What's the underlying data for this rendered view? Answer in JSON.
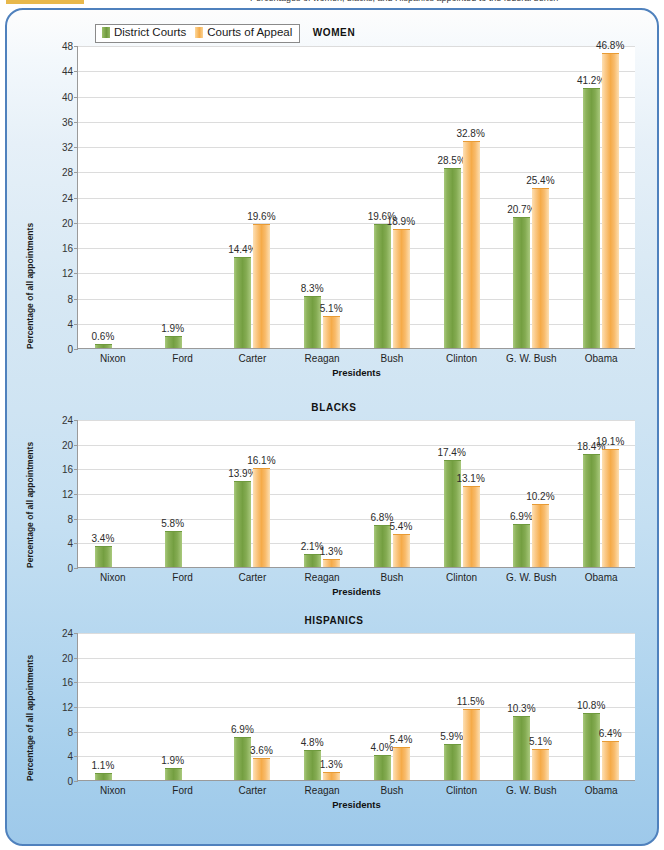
{
  "caption": {
    "highlight": "",
    "text": "Percentages of women, blacks, and Hispanics appointed to the federal bench"
  },
  "legend": {
    "series": [
      {
        "label": "District Courts",
        "color": "#7aa344",
        "key": "district"
      },
      {
        "label": "Courts of Appeal",
        "color": "#f5ab49",
        "key": "appeal"
      }
    ]
  },
  "axis": {
    "ylabel": "Percentage of all appointments",
    "xlabel": "Presidents"
  },
  "chart_data": [
    {
      "type": "bar",
      "title": "WOMEN",
      "xlabel": "Presidents",
      "ylabel": "Percentage of all appointments",
      "ylim": [
        0,
        48
      ],
      "ytick_step": 4,
      "yticks": [
        0,
        4,
        8,
        12,
        16,
        20,
        24,
        28,
        32,
        36,
        40,
        44,
        48
      ],
      "grid": true,
      "legend_position": "top-left",
      "categories": [
        "Nixon",
        "Ford",
        "Carter",
        "Reagan",
        "Bush",
        "Clinton",
        "G. W. Bush",
        "Obama"
      ],
      "series": [
        {
          "name": "District Courts",
          "values": [
            0.6,
            1.9,
            14.4,
            8.3,
            19.6,
            28.5,
            20.7,
            41.2
          ],
          "labels": [
            "0.6%",
            "1.9%",
            "14.4%",
            "8.3%",
            "19.6%",
            "28.5%",
            "20.7%",
            "41.2%"
          ]
        },
        {
          "name": "Courts of Appeal",
          "values": [
            0.0,
            0.0,
            19.6,
            5.1,
            18.9,
            32.8,
            25.4,
            46.8
          ],
          "labels": [
            "",
            "",
            "19.6%",
            "5.1%",
            "18.9%",
            "32.8%",
            "25.4%",
            "46.8%"
          ]
        }
      ]
    },
    {
      "type": "bar",
      "title": "BLACKS",
      "xlabel": "Presidents",
      "ylabel": "Percentage of all appointments",
      "ylim": [
        0,
        24
      ],
      "ytick_step": 4,
      "yticks": [
        0,
        4,
        8,
        12,
        16,
        20,
        24
      ],
      "grid": true,
      "categories": [
        "Nixon",
        "Ford",
        "Carter",
        "Reagan",
        "Bush",
        "Clinton",
        "G. W. Bush",
        "Obama"
      ],
      "series": [
        {
          "name": "District Courts",
          "values": [
            3.4,
            5.8,
            13.9,
            2.1,
            6.8,
            17.4,
            6.9,
            18.4
          ],
          "labels": [
            "3.4%",
            "5.8%",
            "13.9%",
            "2.1%",
            "6.8%",
            "17.4%",
            "6.9%",
            "18.4%"
          ]
        },
        {
          "name": "Courts of Appeal",
          "values": [
            0.0,
            0.0,
            16.1,
            1.3,
            5.4,
            13.1,
            10.2,
            19.1
          ],
          "labels": [
            "",
            "",
            "16.1%",
            "1.3%",
            "5.4%",
            "13.1%",
            "10.2%",
            "19.1%"
          ]
        }
      ]
    },
    {
      "type": "bar",
      "title": "HISPANICS",
      "xlabel": "Presidents",
      "ylabel": "Percentage of all appointments",
      "ylim": [
        0,
        24
      ],
      "ytick_step": 4,
      "yticks": [
        0,
        4,
        8,
        12,
        16,
        20,
        24
      ],
      "grid": true,
      "categories": [
        "Nixon",
        "Ford",
        "Carter",
        "Reagan",
        "Bush",
        "Clinton",
        "G. W. Bush",
        "Obama"
      ],
      "series": [
        {
          "name": "District Courts",
          "values": [
            1.1,
            1.9,
            6.9,
            4.8,
            4.0,
            5.9,
            10.3,
            10.8
          ],
          "labels": [
            "1.1%",
            "1.9%",
            "6.9%",
            "4.8%",
            "4.0%",
            "5.9%",
            "10.3%",
            "10.8%"
          ]
        },
        {
          "name": "Courts of Appeal",
          "values": [
            0.0,
            0.0,
            3.6,
            1.3,
            5.4,
            11.5,
            5.1,
            6.4
          ],
          "labels": [
            "",
            "",
            "3.6%",
            "1.3%",
            "5.4%",
            "11.5%",
            "5.1%",
            "6.4%"
          ]
        }
      ]
    }
  ],
  "colors": {
    "frame_border": "#4f81bd",
    "background_top": "#fdfdfd",
    "background_bottom": "#9ec9ea",
    "series_district": "#7aa344",
    "series_appeal": "#f5ab49",
    "plot_background": "#ffffff",
    "gridline": "#dcdcdc"
  }
}
